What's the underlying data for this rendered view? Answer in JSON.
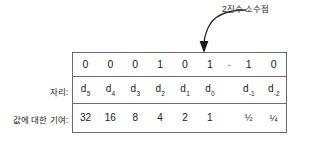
{
  "figure": {
    "callout": {
      "label": "2진수 소수점",
      "arrow_icon": "curved-down-arrow-icon"
    },
    "row_labels": {
      "place": "자리:",
      "weight": "값에 대한 기여:"
    },
    "binary_point": ".",
    "columns": [
      {
        "bit": "0",
        "place_base": "d",
        "place_sub": "5",
        "weight": "32"
      },
      {
        "bit": "0",
        "place_base": "d",
        "place_sub": "4",
        "weight": "16"
      },
      {
        "bit": "0",
        "place_base": "d",
        "place_sub": "3",
        "weight": "8"
      },
      {
        "bit": "1",
        "place_base": "d",
        "place_sub": "2",
        "weight": "4"
      },
      {
        "bit": "0",
        "place_base": "d",
        "place_sub": "1",
        "weight": "2"
      },
      {
        "bit": "1",
        "place_base": "d",
        "place_sub": "0",
        "weight": "1"
      },
      {
        "bit": "1",
        "place_base": "d",
        "place_sub": "-1",
        "weight": "½"
      },
      {
        "bit": "0",
        "place_base": "d",
        "place_sub": "-2",
        "weight": "¼"
      }
    ],
    "colors": {
      "border": "#6b6b6b",
      "text": "#1a1a1a",
      "background": "#ffffff"
    }
  }
}
